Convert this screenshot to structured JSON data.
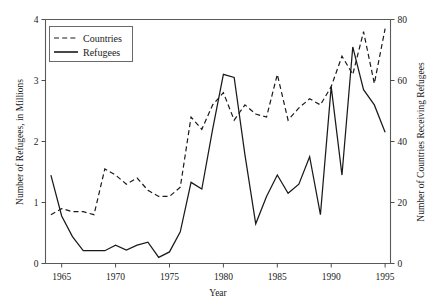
{
  "chart_data": {
    "type": "line",
    "title": "",
    "xlabel": "Year",
    "ylabel": "Number of Refugees, in Millions",
    "y2label": "Number of Countries Receiving Refugees",
    "xlim": [
      1963.5,
      1995.5
    ],
    "ylim": [
      0,
      4
    ],
    "y2lim": [
      0,
      80
    ],
    "grid": false,
    "legend_position": "top-left",
    "xticks": [
      1965,
      1970,
      1975,
      1980,
      1985,
      1990,
      1995
    ],
    "xtick_labels": [
      "1965",
      "1970",
      "1975",
      "1980",
      "1985",
      "1990",
      "1995"
    ],
    "yticks": [
      0,
      1,
      2,
      3,
      4
    ],
    "ytick_labels": [
      "0",
      "1",
      "2",
      "3",
      "4"
    ],
    "y2ticks": [
      0,
      20,
      40,
      60,
      80
    ],
    "y2tick_labels": [
      "0",
      "20",
      "40",
      "60",
      "80"
    ],
    "x": [
      1964,
      1965,
      1966,
      1967,
      1968,
      1969,
      1970,
      1971,
      1972,
      1973,
      1974,
      1975,
      1976,
      1977,
      1978,
      1979,
      1980,
      1981,
      1982,
      1983,
      1984,
      1985,
      1986,
      1987,
      1988,
      1989,
      1990,
      1991,
      1992,
      1993,
      1994,
      1995
    ],
    "series": [
      {
        "name": "Countries",
        "axis": "right",
        "style": "dashed",
        "color": "#1a1a1a",
        "values": [
          16,
          18,
          17,
          17,
          16,
          31,
          29,
          26,
          28,
          24,
          22,
          22,
          25,
          48,
          44,
          52,
          56,
          47,
          52,
          49,
          48,
          62,
          47,
          51,
          54,
          52,
          58,
          68,
          62,
          76,
          59,
          77
        ]
      },
      {
        "name": "Refugees",
        "axis": "left",
        "style": "solid",
        "color": "#1a1a1a",
        "values": [
          1.45,
          0.78,
          0.44,
          0.21,
          0.21,
          0.21,
          0.3,
          0.22,
          0.3,
          0.35,
          0.1,
          0.19,
          0.52,
          1.33,
          1.22,
          2.2,
          3.1,
          3.05,
          1.78,
          0.65,
          1.1,
          1.45,
          1.15,
          1.3,
          1.75,
          0.8,
          2.9,
          1.45,
          3.55,
          2.85,
          2.6,
          2.15
        ]
      }
    ]
  },
  "legend": {
    "entries": [
      {
        "label": "Countries",
        "style": "dashed"
      },
      {
        "label": "Refugees",
        "style": "solid"
      }
    ]
  }
}
